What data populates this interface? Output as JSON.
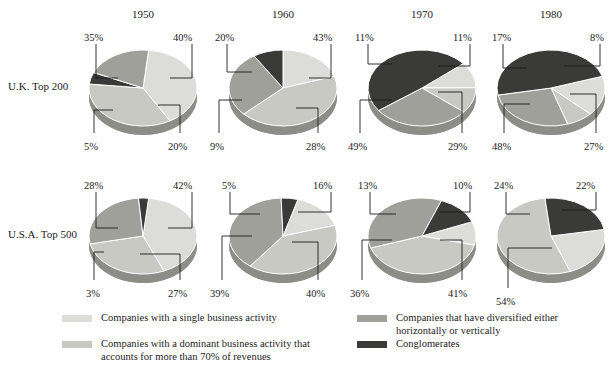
{
  "figure": {
    "background": "#ffffff",
    "columns": [
      "1950",
      "1960",
      "1970",
      "1980"
    ],
    "rows": [
      "U.K. Top 200",
      "U.S.A. Top 500"
    ]
  },
  "colors": {
    "single": "#dcdcd8",
    "dominant": "#c9c9c4",
    "diversified": "#a0a09a",
    "conglomerate": "#3a3a38",
    "rim": "#8d8d87",
    "edge": "#ffffff",
    "leader": "#1c1c1c",
    "text": "#1c1c1c"
  },
  "legend": {
    "items": [
      {
        "key": "single",
        "label": "Companies with a single business activity",
        "color": "#dcdcd8"
      },
      {
        "key": "dominant",
        "label": "Companies with a dominant business activity that\naccounts for more than 70% of revenues",
        "color": "#c9c9c4"
      },
      {
        "key": "diversified",
        "label": "Companies that have diversified either\nhorizontally or vertically",
        "color": "#a0a09a"
      },
      {
        "key": "conglomerate",
        "label": "Conglomerates",
        "color": "#3a3a38"
      }
    ]
  },
  "chart_data": {
    "type": "pie",
    "title": "",
    "xlabel": "",
    "ylabel": "",
    "categories": [
      "Companies with a single business activity",
      "Companies with a dominant business activity that accounts for more than 70% of revenues",
      "Companies that have diversified either horizontally or vertically",
      "Conglomerates"
    ],
    "legend_position": "bottom",
    "grid": false,
    "units": "percent",
    "panels": [
      {
        "row": "U.K. Top 200",
        "year": "1950",
        "slices": [
          {
            "key": "single",
            "value": 40,
            "label": "40%"
          },
          {
            "key": "dominant",
            "value": 35,
            "label": "35%"
          },
          {
            "key": "conglomerate",
            "value": 5,
            "label": "5%"
          },
          {
            "key": "diversified",
            "value": 20,
            "label": "20%"
          }
        ]
      },
      {
        "row": "U.K. Top 200",
        "year": "1960",
        "slices": [
          {
            "key": "single",
            "value": 20,
            "label": "20%"
          },
          {
            "key": "dominant",
            "value": 43,
            "label": "43%"
          },
          {
            "key": "diversified",
            "value": 28,
            "label": "28%"
          },
          {
            "key": "conglomerate",
            "value": 9,
            "label": "9%"
          }
        ]
      },
      {
        "row": "U.K. Top 200",
        "year": "1970",
        "slices": [
          {
            "key": "single",
            "value": 11,
            "label": "11%"
          },
          {
            "key": "dominant",
            "value": 11,
            "label": "11%"
          },
          {
            "key": "diversified",
            "value": 29,
            "label": "29%"
          },
          {
            "key": "conglomerate",
            "value": 49,
            "label": "49%"
          }
        ]
      },
      {
        "row": "U.K. Top 200",
        "year": "1980",
        "slices": [
          {
            "key": "single",
            "value": 17,
            "label": "17%"
          },
          {
            "key": "dominant",
            "value": 8,
            "label": "8%"
          },
          {
            "key": "diversified",
            "value": 27,
            "label": "27%"
          },
          {
            "key": "conglomerate",
            "value": 48,
            "label": "48%"
          }
        ]
      },
      {
        "row": "U.S.A. Top 500",
        "year": "1950",
        "slices": [
          {
            "key": "single",
            "value": 42,
            "label": "42%"
          },
          {
            "key": "dominant",
            "value": 28,
            "label": "28%"
          },
          {
            "key": "diversified",
            "value": 27,
            "label": "27%"
          },
          {
            "key": "conglomerate",
            "value": 3,
            "label": "3%"
          }
        ]
      },
      {
        "row": "U.S.A. Top 500",
        "year": "1960",
        "slices": [
          {
            "key": "single",
            "value": 16,
            "label": "16%"
          },
          {
            "key": "dominant",
            "value": 40,
            "label": "40%"
          },
          {
            "key": "diversified",
            "value": 39,
            "label": "39%"
          },
          {
            "key": "conglomerate",
            "value": 5,
            "label": "5%"
          }
        ]
      },
      {
        "row": "U.S.A. Top 500",
        "year": "1970",
        "slices": [
          {
            "key": "single",
            "value": 10,
            "label": "10%"
          },
          {
            "key": "dominant",
            "value": 41,
            "label": "41%"
          },
          {
            "key": "diversified",
            "value": 36,
            "label": "36%"
          },
          {
            "key": "conglomerate",
            "value": 13,
            "label": "13%"
          }
        ]
      },
      {
        "row": "U.S.A. Top 500",
        "year": "1980",
        "slices": [
          {
            "key": "single",
            "value": 22,
            "label": "22%"
          },
          {
            "key": "dominant",
            "value": 54,
            "label": "54%"
          },
          {
            "key": "diversified",
            "value": 0,
            "label": ""
          },
          {
            "key": "conglomerate",
            "value": 24,
            "label": "24%"
          }
        ]
      }
    ]
  },
  "panel_layout": [
    {
      "id": "uk-1950",
      "cx": 143,
      "cy": 88,
      "rx": 54,
      "ry": 38,
      "depth": 9,
      "start": -84,
      "labels": [
        {
          "text": "35%",
          "x": 84,
          "y": 32,
          "lx": 96,
          "ly": 44,
          "lx2": 96,
          "ly2": 78,
          "lx3": 118,
          "ly3": 78
        },
        {
          "text": "40%",
          "x": 173,
          "y": 32,
          "lx": 192,
          "ly": 44,
          "lx2": 192,
          "ly2": 78,
          "lx3": 170,
          "ly3": 78
        },
        {
          "text": "5%",
          "x": 84,
          "y": 141,
          "lx": 94,
          "ly": 133,
          "lx2": 94,
          "ly2": 110,
          "lx3": 113,
          "ly3": 110
        },
        {
          "text": "20%",
          "x": 168,
          "y": 141,
          "lx": 180,
          "ly": 133,
          "lx2": 180,
          "ly2": 105,
          "lx3": 158,
          "ly3": 105
        }
      ]
    },
    {
      "id": "uk-1960",
      "cx": 283,
      "cy": 88,
      "rx": 54,
      "ry": 38,
      "depth": 9,
      "start": -90,
      "labels": [
        {
          "text": "20%",
          "x": 215,
          "y": 32,
          "lx": 227,
          "ly": 44,
          "lx2": 227,
          "ly2": 72,
          "lx3": 252,
          "ly3": 72
        },
        {
          "text": "43%",
          "x": 313,
          "y": 32,
          "lx": 331,
          "ly": 44,
          "lx2": 331,
          "ly2": 78,
          "lx3": 309,
          "ly3": 78
        },
        {
          "text": "9%",
          "x": 210,
          "y": 141,
          "lx": 219,
          "ly": 133,
          "lx2": 219,
          "ly2": 100,
          "lx3": 242,
          "ly3": 100
        },
        {
          "text": "28%",
          "x": 306,
          "y": 141,
          "lx": 318,
          "ly": 133,
          "lx2": 318,
          "ly2": 108,
          "lx3": 296,
          "ly3": 108
        }
      ]
    },
    {
      "id": "uk-1970",
      "cx": 422,
      "cy": 88,
      "rx": 54,
      "ry": 38,
      "depth": 9,
      "start": -40,
      "labels": [
        {
          "text": "11%",
          "x": 355,
          "y": 32,
          "lx": 368,
          "ly": 44,
          "lx2": 368,
          "ly2": 64,
          "lx3": 392,
          "ly3": 64
        },
        {
          "text": "11%",
          "x": 453,
          "y": 32,
          "lx": 470,
          "ly": 44,
          "lx2": 470,
          "ly2": 66,
          "lx3": 438,
          "ly3": 66
        },
        {
          "text": "49%",
          "x": 348,
          "y": 141,
          "lx": 360,
          "ly": 133,
          "lx2": 360,
          "ly2": 100,
          "lx3": 392,
          "ly3": 100
        },
        {
          "text": "29%",
          "x": 448,
          "y": 141,
          "lx": 462,
          "ly": 133,
          "lx2": 462,
          "ly2": 92,
          "lx3": 438,
          "ly3": 92
        }
      ]
    },
    {
      "id": "uk-1980",
      "cx": 551,
      "cy": 88,
      "rx": 54,
      "ry": 38,
      "depth": 9,
      "start": -18,
      "labels": [
        {
          "text": "17%",
          "x": 492,
          "y": 32,
          "lx": 503,
          "ly": 44,
          "lx2": 503,
          "ly2": 68,
          "lx3": 526,
          "ly3": 68
        },
        {
          "text": "8%",
          "x": 590,
          "y": 32,
          "lx": 600,
          "ly": 44,
          "lx2": 600,
          "ly2": 66,
          "lx3": 564,
          "ly3": 66
        },
        {
          "text": "48%",
          "x": 492,
          "y": 141,
          "lx": 504,
          "ly": 133,
          "lx2": 504,
          "ly2": 104,
          "lx3": 530,
          "ly3": 104
        },
        {
          "text": "27%",
          "x": 584,
          "y": 141,
          "lx": 596,
          "ly": 133,
          "lx2": 596,
          "ly2": 94,
          "lx3": 570,
          "ly3": 94
        }
      ]
    },
    {
      "id": "usa-1950",
      "cx": 143,
      "cy": 236,
      "rx": 54,
      "ry": 38,
      "depth": 9,
      "start": -84,
      "labels": [
        {
          "text": "28%",
          "x": 84,
          "y": 180,
          "lx": 96,
          "ly": 192,
          "lx2": 96,
          "ly2": 228,
          "lx3": 118,
          "ly3": 228
        },
        {
          "text": "42%",
          "x": 173,
          "y": 180,
          "lx": 192,
          "ly": 192,
          "lx2": 192,
          "ly2": 228,
          "lx3": 168,
          "ly3": 228
        },
        {
          "text": "3%",
          "x": 86,
          "y": 288,
          "lx": 94,
          "ly": 280,
          "lx2": 94,
          "ly2": 252,
          "lx3": 104,
          "ly3": 252
        },
        {
          "text": "27%",
          "x": 168,
          "y": 288,
          "lx": 180,
          "ly": 280,
          "lx2": 180,
          "ly2": 254,
          "lx3": 140,
          "ly3": 254
        }
      ]
    },
    {
      "id": "usa-1960",
      "cx": 283,
      "cy": 236,
      "rx": 54,
      "ry": 38,
      "depth": 9,
      "start": -74,
      "labels": [
        {
          "text": "5%",
          "x": 222,
          "y": 180,
          "lx": 230,
          "ly": 192,
          "lx2": 230,
          "ly2": 214,
          "lx3": 260,
          "ly3": 214
        },
        {
          "text": "16%",
          "x": 313,
          "y": 180,
          "lx": 331,
          "ly": 192,
          "lx2": 331,
          "ly2": 212,
          "lx3": 298,
          "ly3": 212
        },
        {
          "text": "39%",
          "x": 210,
          "y": 288,
          "lx": 222,
          "ly": 280,
          "lx2": 222,
          "ly2": 236,
          "lx3": 252,
          "ly3": 236
        },
        {
          "text": "40%",
          "x": 306,
          "y": 288,
          "lx": 318,
          "ly": 280,
          "lx2": 318,
          "ly2": 242,
          "lx3": 292,
          "ly3": 242
        }
      ]
    },
    {
      "id": "usa-1970",
      "cx": 422,
      "cy": 236,
      "rx": 54,
      "ry": 38,
      "depth": 9,
      "start": -22,
      "labels": [
        {
          "text": "13%",
          "x": 358,
          "y": 180,
          "lx": 370,
          "ly": 192,
          "lx2": 370,
          "ly2": 214,
          "lx3": 396,
          "ly3": 214
        },
        {
          "text": "10%",
          "x": 453,
          "y": 180,
          "lx": 470,
          "ly": 192,
          "lx2": 470,
          "ly2": 212,
          "lx3": 440,
          "ly3": 212
        },
        {
          "text": "36%",
          "x": 350,
          "y": 288,
          "lx": 362,
          "ly": 280,
          "lx2": 362,
          "ly2": 240,
          "lx3": 392,
          "ly3": 240
        },
        {
          "text": "41%",
          "x": 448,
          "y": 288,
          "lx": 462,
          "ly": 280,
          "lx2": 462,
          "ly2": 240,
          "lx3": 440,
          "ly3": 240
        }
      ]
    },
    {
      "id": "usa-1980",
      "cx": 551,
      "cy": 236,
      "rx": 54,
      "ry": 38,
      "depth": 9,
      "start": -10,
      "labels": [
        {
          "text": "24%",
          "x": 494,
          "y": 180,
          "lx": 506,
          "ly": 192,
          "lx2": 506,
          "ly2": 214,
          "lx3": 530,
          "ly3": 214
        },
        {
          "text": "22%",
          "x": 576,
          "y": 180,
          "lx": 596,
          "ly": 192,
          "lx2": 596,
          "ly2": 210,
          "lx3": 562,
          "ly3": 210
        },
        {
          "text": "54%",
          "x": 496,
          "y": 296,
          "lx": 508,
          "ly": 288,
          "lx2": 508,
          "ly2": 248,
          "lx3": 552,
          "ly3": 248
        }
      ]
    }
  ]
}
